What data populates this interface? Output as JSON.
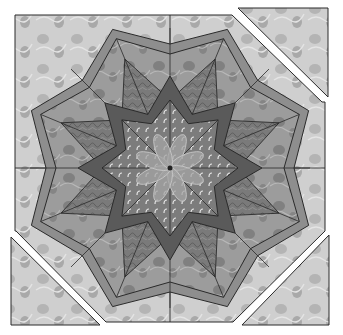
{
  "image": {
    "subject": "Octagonal eight-pointed star quilt block",
    "width": 343,
    "height": 335
  },
  "colors": {
    "background": "#ffffff",
    "light_fabric": "#cfcfcf",
    "light_fabric_spot": "#a9a9a9",
    "band": "#8e8e8e",
    "mid_fabric": "#9c9c9c",
    "mid_fabric_spot": "#7e7e7e",
    "dark_star": "#5a5a5a",
    "swirl_fabric": "#7a7a7a",
    "center_fabric": "#808080",
    "center_dots": "#e6e6e6",
    "flower": "#a4a4a4",
    "outline": "#2a2a2a"
  },
  "block": {
    "center": [
      170,
      168
    ],
    "outer_square": [
      15,
      15,
      325,
      322
    ],
    "detached_corners": [
      {
        "name": "top-right",
        "points": "238,8 328,8 328,97"
      },
      {
        "name": "bottom-left",
        "points": "11,237 11,325 100,325"
      },
      {
        "name": "bottom-right",
        "points": "242,325 329,325 329,235"
      }
    ],
    "star_points": 8,
    "flower_petals": 8
  }
}
